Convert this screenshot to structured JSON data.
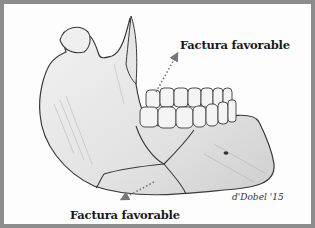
{
  "figure": {
    "labels": {
      "top": "Factura favorable",
      "bottom": "Factura favorable"
    },
    "signature": "d'Dobel '15",
    "colors": {
      "border": "#8c8c8c",
      "background": "#fdfdfd",
      "bone_fill": "#e9e9e9",
      "line": "#3a3a3a",
      "arrow": "#777777"
    }
  }
}
